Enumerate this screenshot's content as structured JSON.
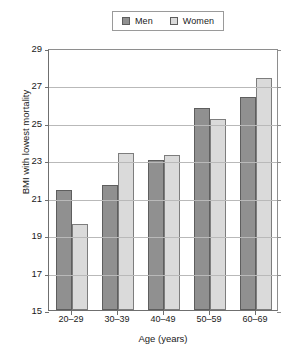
{
  "chart_data": {
    "type": "bar",
    "title": "",
    "xlabel": "Age (years)",
    "ylabel": "BMI with lowest mortality",
    "categories": [
      "20–29",
      "30–39",
      "40–49",
      "50–59",
      "60–69"
    ],
    "series": [
      {
        "name": "Men",
        "color": "#909090",
        "values": [
          21.4,
          21.7,
          23.0,
          25.8,
          26.4
        ]
      },
      {
        "name": "Women",
        "color": "#dadada",
        "values": [
          19.6,
          23.4,
          23.3,
          25.2,
          27.4
        ]
      }
    ],
    "ylim": [
      15,
      29
    ],
    "ytick_labels": [
      "29",
      "27",
      "25",
      "23",
      "21",
      "19",
      "17",
      "15"
    ],
    "ytick_values": [
      29,
      27,
      25,
      23,
      21,
      19,
      17,
      15
    ],
    "grid": true,
    "legend_position": "top-center"
  },
  "legend": {
    "items": [
      {
        "label": "Men",
        "swatch": "#909090"
      },
      {
        "label": "Women",
        "swatch": "#dadada"
      }
    ]
  }
}
